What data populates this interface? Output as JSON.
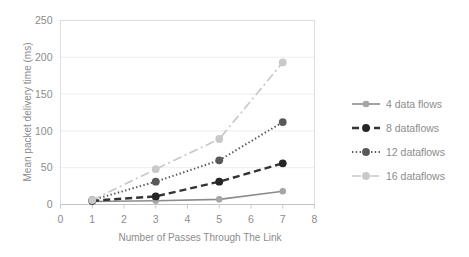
{
  "chart_data": {
    "type": "line",
    "title": "",
    "xlabel": "Number of Passes Through The Link",
    "ylabel": "Mean packet delivery time (ms)",
    "x": [
      1,
      3,
      5,
      7
    ],
    "xlim": [
      0,
      8
    ],
    "ylim": [
      0,
      250
    ],
    "xticks": [
      "0",
      "1",
      "2",
      "3",
      "4",
      "5",
      "6",
      "7",
      "8"
    ],
    "yticks": [
      "0",
      "50",
      "100",
      "150",
      "200",
      "250"
    ],
    "grid": "horizontal",
    "legend_position": "right",
    "series": [
      {
        "name": "4 data flows",
        "values": [
          4,
          5,
          7,
          18
        ],
        "color": "#8c8c8c",
        "linestyle": "solid",
        "marker_color": "#a6a6a6"
      },
      {
        "name": "8 dataflows",
        "values": [
          5,
          11,
          31,
          56
        ],
        "color": "#333333",
        "linestyle": "dashed",
        "marker_color": "#262626"
      },
      {
        "name": "12 dataflows",
        "values": [
          6,
          31,
          60,
          112
        ],
        "color": "#595959",
        "linestyle": "dotted",
        "marker_color": "#595959"
      },
      {
        "name": "16 dataflows",
        "values": [
          6,
          48,
          89,
          193
        ],
        "color": "#c9c9c9",
        "linestyle": "dashdot",
        "marker_color": "#c9c9c9"
      }
    ]
  },
  "axes": {
    "x_title": "Number of Passes Through The Link",
    "y_title": "Mean packet delivery time (ms)",
    "x_tick_labels": [
      "0",
      "1",
      "2",
      "3",
      "4",
      "5",
      "6",
      "7",
      "8"
    ],
    "y_tick_labels": [
      "0",
      "50",
      "100",
      "150",
      "200",
      "250"
    ]
  },
  "legend": {
    "items": [
      {
        "label": "4 data flows"
      },
      {
        "label": "8 dataflows"
      },
      {
        "label": "12 dataflows"
      },
      {
        "label": "16 dataflows"
      }
    ]
  },
  "colors": {
    "gridline": "#e8e8e8",
    "axis": "#bfbfbf",
    "text": "#8c8c8c",
    "background": "#ffffff"
  }
}
